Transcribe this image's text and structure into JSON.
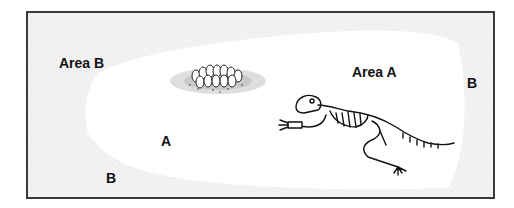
{
  "figure": {
    "labels": {
      "area_b_title": "Area B",
      "area_a_title": "Area A",
      "b_right": "B",
      "a_middle": "A",
      "b_bottom": "B"
    },
    "illustrations": {
      "nest": "egg-nest-icon",
      "skeleton": "dinosaur-skeleton-icon"
    },
    "colors": {
      "border": "#3a3a3a",
      "area_b_fill": "#f0f0f0",
      "area_a_fill": "#ffffff",
      "text": "#111111"
    }
  }
}
